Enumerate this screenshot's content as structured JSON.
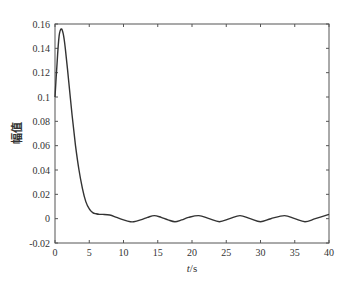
{
  "chart_data": {
    "type": "line",
    "title": "",
    "xlabel": "t/s",
    "ylabel": "幅值",
    "xlim": [
      0,
      40
    ],
    "ylim": [
      -0.02,
      0.16
    ],
    "xticks": [
      0,
      5,
      10,
      15,
      20,
      25,
      30,
      35,
      40
    ],
    "yticks": [
      -0.02,
      0,
      0.02,
      0.04,
      0.06,
      0.08,
      0.1,
      0.12,
      0.14,
      0.16
    ],
    "ytick_labels": [
      "-0.02",
      "0",
      "0.02",
      "0.04",
      "0.06",
      "0.08",
      "0.1",
      "0.12",
      "0.14",
      "0.16"
    ],
    "grid": false,
    "legend": null,
    "series": [
      {
        "name": "amplitude",
        "color": "#333333",
        "x": [
          0,
          0.3,
          0.6,
          0.9,
          1.2,
          1.5,
          2,
          2.5,
          3,
          3.5,
          4,
          4.5,
          5,
          5.5,
          6,
          6.5,
          7,
          8,
          9,
          10,
          11,
          11.5,
          12.5,
          13.5,
          14.5,
          15.5,
          16.5,
          17.5,
          18.5,
          19.5,
          21,
          22.5,
          24,
          25.5,
          27,
          28.5,
          30,
          31.5,
          33.5,
          35,
          36.5,
          38,
          40
        ],
        "y": [
          0.1,
          0.128,
          0.15,
          0.156,
          0.152,
          0.14,
          0.113,
          0.085,
          0.06,
          0.04,
          0.025,
          0.014,
          0.008,
          0.005,
          0.004,
          0.0035,
          0.0035,
          0.003,
          0.001,
          -0.001,
          -0.0025,
          -0.0025,
          -0.001,
          0.001,
          0.0025,
          0.001,
          -0.001,
          -0.0025,
          -0.001,
          0.001,
          0.0025,
          0.0,
          -0.0025,
          0.0,
          0.0025,
          0.0,
          -0.0025,
          0.0,
          0.0025,
          0.0,
          -0.0025,
          0.0,
          0.0035
        ]
      }
    ]
  },
  "labels": {
    "xlabel_italic": "t",
    "xlabel_unit": "/s",
    "ylabel": "幅值"
  }
}
